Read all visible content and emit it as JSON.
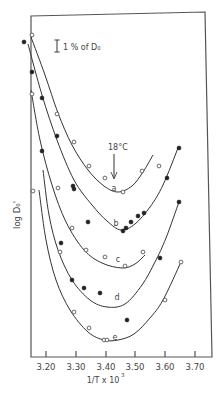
{
  "chart_data": {
    "type": "line",
    "title": "",
    "xlabel": "1/T x 10³",
    "ylabel": "log D₀'",
    "xlim": [
      3.14,
      3.74
    ],
    "x_ticks": [
      "3.20",
      "3.30",
      "3.40",
      "3.50",
      "3.60",
      "3.70"
    ],
    "x_tick_values": [
      3.2,
      3.3,
      3.4,
      3.5,
      3.6,
      3.7
    ],
    "y_ticks": [],
    "grid": false,
    "legend": null,
    "scale_bar_label": "1 % of D₀",
    "annotations": [
      {
        "text": "18°C",
        "x": 3.43,
        "note": "arrow pointing down to curve a minimum"
      }
    ],
    "series": [
      {
        "name": "a",
        "marker": "open",
        "curve_px": [
          [
            31,
            37
          ],
          [
            45,
            75
          ],
          [
            58,
            113
          ],
          [
            72,
            145
          ],
          [
            88,
            170
          ],
          [
            104,
            186
          ],
          [
            118,
            192
          ],
          [
            132,
            186
          ],
          [
            143,
            172
          ],
          [
            153,
            155
          ]
        ],
        "points_px": [
          [
            32,
            35,
            "open"
          ],
          [
            57,
            114,
            "open"
          ],
          [
            74,
            142,
            "open"
          ],
          [
            89,
            166,
            "open"
          ],
          [
            105,
            178,
            "open"
          ],
          [
            123,
            192,
            "open"
          ],
          [
            142,
            171,
            "open"
          ],
          [
            159,
            166,
            "open"
          ]
        ],
        "label_px": [
          114,
          188
        ]
      },
      {
        "name": "b",
        "marker": "filled",
        "curve_px": [
          [
            28,
            44
          ],
          [
            42,
            95
          ],
          [
            57,
            140
          ],
          [
            74,
            180
          ],
          [
            92,
            205
          ],
          [
            107,
            221
          ],
          [
            121,
            230
          ],
          [
            135,
            224
          ],
          [
            150,
            207
          ],
          [
            163,
            185
          ],
          [
            178,
            148
          ]
        ],
        "points_px": [
          [
            24,
            42,
            "filled"
          ],
          [
            32,
            72,
            "filled"
          ],
          [
            42,
            98,
            "filled"
          ],
          [
            57,
            136,
            "filled"
          ],
          [
            73,
            186,
            "filled"
          ],
          [
            74,
            189,
            "filled"
          ],
          [
            88,
            222,
            "filled"
          ],
          [
            123,
            231,
            "filled"
          ],
          [
            126,
            228,
            "filled"
          ],
          [
            131,
            222,
            "filled"
          ],
          [
            138,
            216,
            "filled"
          ],
          [
            144,
            213,
            "filled"
          ],
          [
            167,
            178,
            "filled"
          ],
          [
            179,
            148,
            "filled"
          ]
        ],
        "label_px": [
          116,
          224
        ]
      },
      {
        "name": "c",
        "marker": "open",
        "curve_px": [
          [
            31,
            90
          ],
          [
            40,
            140
          ],
          [
            52,
            185
          ],
          [
            66,
            222
          ],
          [
            84,
            250
          ],
          [
            102,
            263
          ],
          [
            122,
            268
          ],
          [
            135,
            264
          ],
          [
            145,
            255
          ]
        ],
        "points_px": [
          [
            32,
            94,
            "open"
          ],
          [
            58,
            188,
            "open"
          ],
          [
            72,
            228,
            "open"
          ],
          [
            86,
            250,
            "open"
          ],
          [
            105,
            257,
            "open"
          ],
          [
            125,
            266,
            "open"
          ],
          [
            143,
            252,
            "open"
          ]
        ],
        "label_px": [
          118,
          260
        ]
      },
      {
        "name": "d",
        "marker": "filled",
        "curve_px": [
          [
            43,
            170
          ],
          [
            49,
            215
          ],
          [
            58,
            250
          ],
          [
            72,
            280
          ],
          [
            90,
            300
          ],
          [
            107,
            307
          ],
          [
            125,
            304
          ],
          [
            142,
            285
          ],
          [
            155,
            262
          ],
          [
            166,
            238
          ],
          [
            179,
            202
          ]
        ],
        "points_px": [
          [
            42,
            151,
            "filled"
          ],
          [
            61,
            243,
            "filled"
          ],
          [
            72,
            280,
            "filled"
          ],
          [
            84,
            288,
            "filled"
          ],
          [
            100,
            293,
            "filled"
          ],
          [
            160,
            258,
            "filled"
          ],
          [
            179,
            202,
            "filled"
          ]
        ],
        "label_px": [
          117,
          298
        ]
      },
      {
        "name": "e",
        "marker": "open",
        "curve_px": [
          [
            39,
            190
          ],
          [
            46,
            240
          ],
          [
            56,
            280
          ],
          [
            70,
            310
          ],
          [
            88,
            332
          ],
          [
            104,
            340
          ],
          [
            118,
            340
          ],
          [
            134,
            334
          ],
          [
            150,
            318
          ],
          [
            163,
            300
          ],
          [
            181,
            262
          ]
        ],
        "points_px": [
          [
            33,
            191,
            "open"
          ],
          [
            60,
            252,
            "open"
          ],
          [
            74,
            312,
            "open"
          ],
          [
            89,
            328,
            "open"
          ],
          [
            104,
            340,
            "open"
          ],
          [
            107,
            340,
            "open"
          ],
          [
            127,
            320,
            "filled"
          ],
          [
            165,
            300,
            "open"
          ],
          [
            181,
            262,
            "open"
          ]
        ],
        "label_px": [
          115,
          338
        ]
      }
    ]
  },
  "labels": {
    "y_axis": "log D₀'",
    "x_axis_main": "1/T x 10",
    "x_axis_sup": "3",
    "scale_bar": "1 % of D₀",
    "temp_annotation": "18°C",
    "curve_a": "a",
    "curve_b": "b",
    "curve_c": "c",
    "curve_d": "d",
    "curve_e": "e",
    "tick_0": "3.20",
    "tick_1": "3.30",
    "tick_2": "3.40",
    "tick_3": "3.50",
    "tick_4": "3.60",
    "tick_5": "3.70"
  },
  "colors": {
    "ink": "#333333",
    "background": "#ffffff"
  }
}
